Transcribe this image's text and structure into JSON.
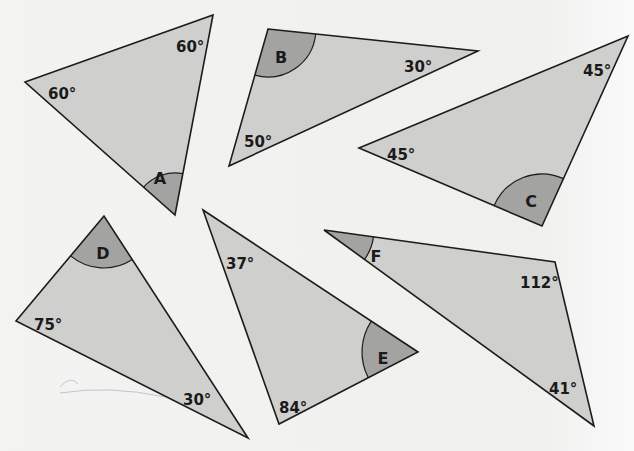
{
  "colors": {
    "background": "#f1f1f0",
    "triangle_fill": "#cfcfce",
    "arc_fill": "#a3a3a2",
    "stroke": "#1c1c1c"
  },
  "triangles": [
    {
      "id": "A",
      "points": [
        [
          25,
          82
        ],
        [
          213,
          15
        ],
        [
          175,
          215
        ]
      ],
      "unknown_vertex": 2,
      "arc_radius": 42,
      "letter": "A",
      "letter_pos": [
        160,
        179
      ],
      "angles": [
        {
          "label": "60°",
          "pos": [
            48,
            94
          ]
        },
        {
          "label": "60°",
          "pos": [
            176,
            47
          ]
        }
      ]
    },
    {
      "id": "B",
      "points": [
        [
          268,
          29
        ],
        [
          478,
          51
        ],
        [
          229,
          166
        ]
      ],
      "unknown_vertex": 0,
      "arc_radius": 48,
      "letter": "B",
      "letter_pos": [
        281,
        58
      ],
      "angles": [
        {
          "label": "30°",
          "pos": [
            404,
            67
          ]
        },
        {
          "label": "50°",
          "pos": [
            244,
            142
          ]
        }
      ]
    },
    {
      "id": "C",
      "points": [
        [
          359,
          148
        ],
        [
          628,
          36
        ],
        [
          542,
          226
        ]
      ],
      "unknown_vertex": 2,
      "arc_radius": 52,
      "letter": "C",
      "letter_pos": [
        531,
        202
      ],
      "angles": [
        {
          "label": "45°",
          "pos": [
            387,
            155
          ]
        },
        {
          "label": "45°",
          "pos": [
            583,
            71
          ]
        }
      ]
    },
    {
      "id": "D",
      "points": [
        [
          104,
          216
        ],
        [
          16,
          321
        ],
        [
          248,
          438
        ]
      ],
      "unknown_vertex": 0,
      "arc_radius": 52,
      "letter": "D",
      "letter_pos": [
        103,
        254
      ],
      "angles": [
        {
          "label": "75°",
          "pos": [
            34,
            325
          ]
        },
        {
          "label": "30°",
          "pos": [
            183,
            400
          ]
        }
      ]
    },
    {
      "id": "E",
      "points": [
        [
          203,
          210
        ],
        [
          418,
          352
        ],
        [
          279,
          424
        ]
      ],
      "unknown_vertex": 1,
      "arc_radius": 56,
      "letter": "E",
      "letter_pos": [
        383,
        359
      ],
      "angles": [
        {
          "label": "37°",
          "pos": [
            226,
            264
          ]
        },
        {
          "label": "84°",
          "pos": [
            279,
            408
          ]
        }
      ]
    },
    {
      "id": "F",
      "points": [
        [
          324,
          230
        ],
        [
          555,
          262
        ],
        [
          594,
          426
        ]
      ],
      "unknown_vertex": 0,
      "arc_radius": 50,
      "letter": "F",
      "letter_pos": [
        376,
        257
      ],
      "angles": [
        {
          "label": "112°",
          "pos": [
            520,
            283
          ]
        },
        {
          "label": "41°",
          "pos": [
            549,
            389
          ]
        }
      ]
    }
  ]
}
